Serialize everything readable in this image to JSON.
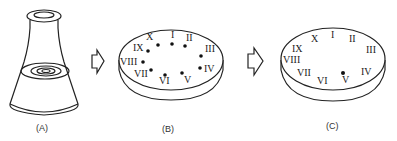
{
  "panels": [
    {
      "id": "A",
      "label": "(A)",
      "object": "conical flask with liquid"
    },
    {
      "id": "B",
      "label": "(B)",
      "object": "petri dish with colonies",
      "marks": [
        {
          "numeral": "X",
          "x": 147,
          "y": 41
        },
        {
          "numeral": "I",
          "x": 172,
          "y": 37
        },
        {
          "numeral": "II",
          "x": 186,
          "y": 41
        },
        {
          "numeral": "III",
          "x": 207,
          "y": 50
        },
        {
          "numeral": "IV",
          "x": 207,
          "y": 69
        },
        {
          "numeral": "V",
          "x": 186,
          "y": 78
        },
        {
          "numeral": "VI",
          "x": 163,
          "y": 80
        },
        {
          "numeral": "VII",
          "x": 140,
          "y": 72
        },
        {
          "numeral": "VIII",
          "x": 134,
          "y": 60
        },
        {
          "numeral": "IX",
          "x": 142,
          "y": 47
        }
      ]
    },
    {
      "id": "C",
      "label": "(C)",
      "object": "petri dish with single colony",
      "numerals": [
        "X",
        "I",
        "II",
        "III",
        "IV",
        "V",
        "VI",
        "VII",
        "VIII",
        "IX"
      ],
      "dot_at": "V"
    }
  ],
  "arrows": [
    {
      "from": "A",
      "to": "B",
      "icon": "hollow-right-arrow-icon"
    },
    {
      "from": "B",
      "to": "C",
      "icon": "hollow-right-arrow-icon"
    }
  ]
}
